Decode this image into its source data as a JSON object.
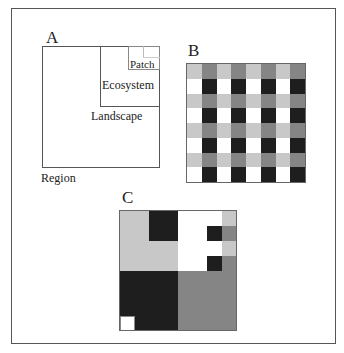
{
  "figure": {
    "colors": {
      "white": "#ffffff",
      "light_gray": "#c8c8c8",
      "medium_gray": "#858585",
      "black": "#1e1e1e",
      "line": "#555555",
      "faint_line": "#bbbbbb"
    },
    "panel_a": {
      "label": "A",
      "levels": [
        {
          "name": "Region",
          "label": "Region"
        },
        {
          "name": "Landscape",
          "label": "Landscape"
        },
        {
          "name": "Ecosystem",
          "label": "Ecosystem"
        },
        {
          "name": "Patch",
          "label": "Patch"
        }
      ]
    },
    "panel_b": {
      "label": "B",
      "grid_size": 8,
      "pattern_rows": [
        [
          "light_gray",
          "medium_gray",
          "light_gray",
          "medium_gray",
          "light_gray",
          "medium_gray",
          "light_gray",
          "medium_gray"
        ],
        [
          "white",
          "black",
          "white",
          "black",
          "white",
          "black",
          "white",
          "black"
        ],
        [
          "light_gray",
          "medium_gray",
          "light_gray",
          "medium_gray",
          "light_gray",
          "medium_gray",
          "light_gray",
          "medium_gray"
        ],
        [
          "white",
          "black",
          "white",
          "black",
          "white",
          "black",
          "white",
          "black"
        ],
        [
          "light_gray",
          "medium_gray",
          "light_gray",
          "medium_gray",
          "light_gray",
          "medium_gray",
          "light_gray",
          "medium_gray"
        ],
        [
          "white",
          "black",
          "white",
          "black",
          "white",
          "black",
          "white",
          "black"
        ],
        [
          "light_gray",
          "medium_gray",
          "light_gray",
          "medium_gray",
          "light_gray",
          "medium_gray",
          "light_gray",
          "medium_gray"
        ],
        [
          "white",
          "black",
          "white",
          "black",
          "white",
          "black",
          "white",
          "black"
        ]
      ]
    },
    "panel_c": {
      "label": "C",
      "quadrants": {
        "top_left": "light_gray",
        "top_right": "white",
        "bottom_left": "black",
        "bottom_right": "medium_gray"
      },
      "sub_features": [
        {
          "desc": "dark block in top-left quadrant (upper-right sub-quadrant)",
          "color": "black"
        },
        {
          "desc": "column of alternating light/medium gray cells at right edge of top-right quadrant",
          "colors": [
            "light_gray",
            "medium_gray",
            "light_gray",
            "medium_gray"
          ]
        },
        {
          "desc": "two dark cells left of gray column in top-right quadrant",
          "color": "black"
        },
        {
          "desc": "small white square in bottom-left corner of black quadrant",
          "color": "white"
        }
      ]
    }
  }
}
